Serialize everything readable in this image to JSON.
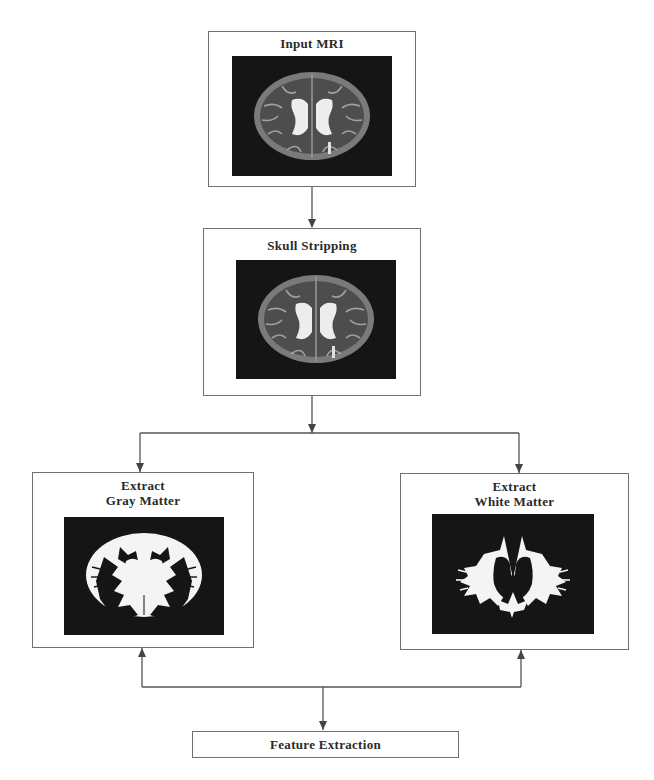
{
  "diagram": {
    "nodes": {
      "input_mri": {
        "title": "Input MRI",
        "image": "mri-axial-slice"
      },
      "skull_stripping": {
        "title": "Skull Stripping",
        "image": "skull-stripped-mri"
      },
      "gray_matter": {
        "title_line1": "Extract",
        "title_line2": "Gray Matter",
        "image": "gray-matter-mask"
      },
      "white_matter": {
        "title_line1": "Extract",
        "title_line2": "White Matter",
        "image": "white-matter-mask"
      },
      "feature_extraction": {
        "title": "Feature Extraction"
      }
    },
    "edges": [
      {
        "from": "Input MRI",
        "to": "Skull Stripping"
      },
      {
        "from": "Skull Stripping",
        "to": "Extract Gray Matter"
      },
      {
        "from": "Skull Stripping",
        "to": "Extract White Matter"
      },
      {
        "from": "Feature Extraction",
        "to": "Extract Gray Matter"
      },
      {
        "from": "Feature Extraction",
        "to": "Extract White Matter"
      }
    ],
    "colors": {
      "line": "#555555",
      "border": "#6f6f6f",
      "image_bg": "#151515",
      "text": "#2a2a2a"
    }
  }
}
